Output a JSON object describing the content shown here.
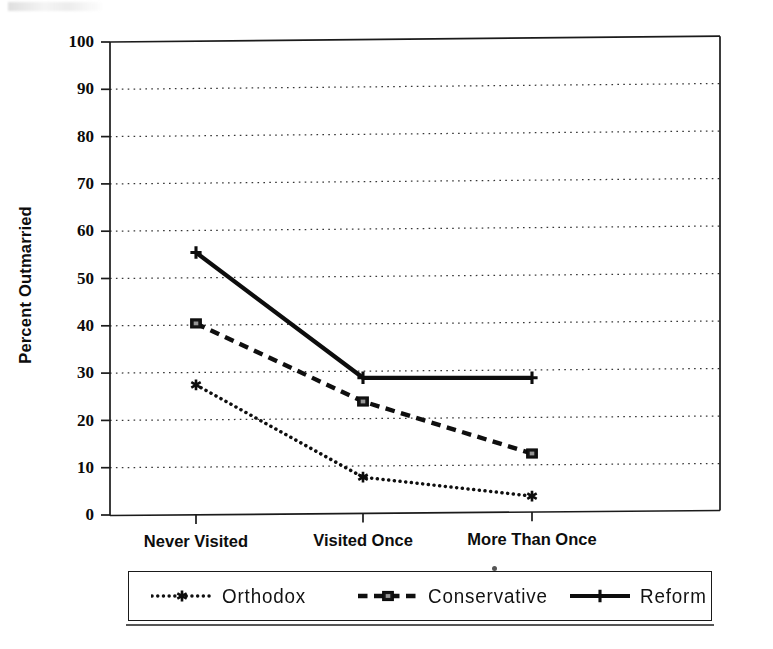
{
  "figure": {
    "y_axis_title": "Percent Outmarried"
  },
  "chart_data": {
    "type": "line",
    "title": "",
    "subtitle": "",
    "xlabel": "",
    "ylabel": "Percent Outmarried",
    "categories": [
      "Never Visited",
      "Visited Once",
      "More Than Once"
    ],
    "ylim": [
      0,
      100
    ],
    "yticks": [
      0,
      10,
      20,
      30,
      40,
      50,
      60,
      70,
      80,
      90,
      100
    ],
    "ytick_labels": [
      "0",
      "10",
      "20",
      "30",
      "40",
      "50",
      "60",
      "70",
      "80",
      "90",
      "100"
    ],
    "grid": true,
    "grid_style": "dotted",
    "legend_position": "below",
    "series": [
      {
        "name": "Orthodox",
        "values": [
          27.5,
          8,
          4
        ],
        "line_style": "dotted",
        "marker": "asterisk",
        "color": "#111111"
      },
      {
        "name": "Conservative",
        "values": [
          40.5,
          24,
          13
        ],
        "line_style": "dashed",
        "marker": "square",
        "color": "#111111"
      },
      {
        "name": "Reform",
        "values": [
          55.5,
          29,
          29
        ],
        "line_style": "solid",
        "marker": "plus",
        "color": "#111111"
      }
    ]
  },
  "legend": {
    "entries": [
      {
        "label": "Orthodox"
      },
      {
        "label": "Conservative"
      },
      {
        "label": "Reform"
      }
    ]
  }
}
